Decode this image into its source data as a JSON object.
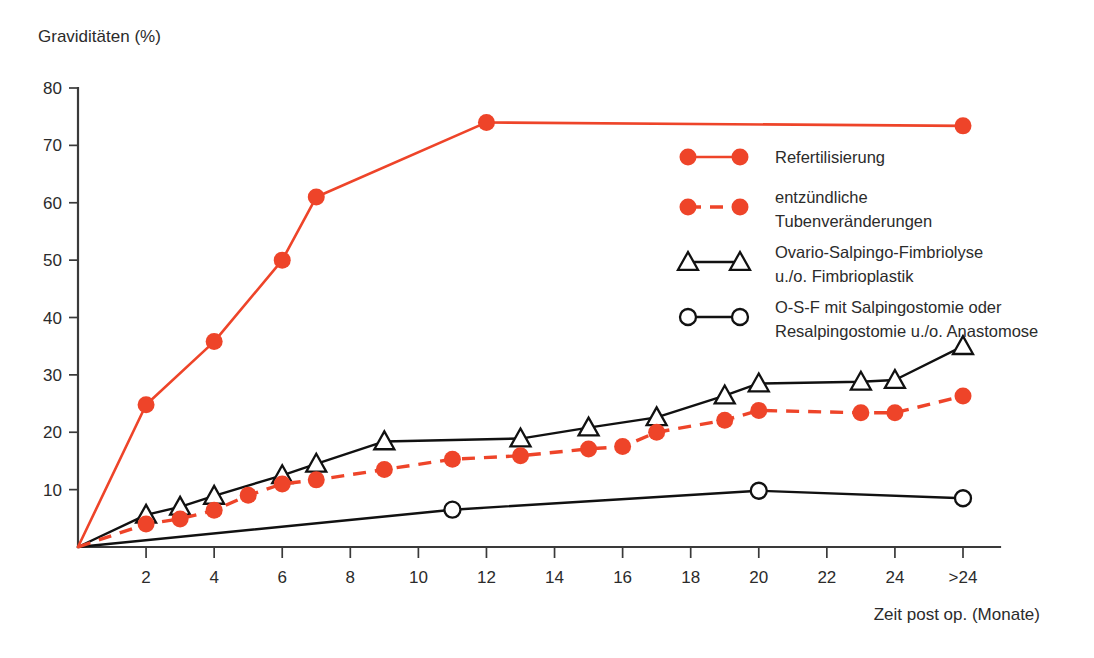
{
  "chart_data": {
    "type": "line",
    "title": "",
    "ylabel": "Graviditäten (%)",
    "xlabel": "Zeit post op. (Monate)",
    "xlim": [
      0,
      26
    ],
    "ylim": [
      0,
      80
    ],
    "grid": false,
    "legend_position": "upper-right",
    "y_ticks": [
      10,
      20,
      30,
      40,
      50,
      60,
      70,
      80
    ],
    "x_ticks": [
      2,
      4,
      6,
      8,
      10,
      12,
      14,
      16,
      18,
      20,
      22,
      24,
      26
    ],
    "x_tick_labels": [
      "2",
      "4",
      "6",
      "8",
      "10",
      "12",
      "14",
      "16",
      "18",
      "20",
      "22",
      "24",
      ">24"
    ],
    "series": [
      {
        "name": "Refertilisierung",
        "color": "#EE4429",
        "style": "solid",
        "marker": "filled-circle",
        "x": [
          0,
          2,
          4,
          6,
          7,
          12,
          26
        ],
        "values": [
          0,
          24.8,
          35.8,
          50.0,
          61.0,
          74.0,
          73.4
        ]
      },
      {
        "name": "entzündliche Tubenveränderungen",
        "color": "#EE4429",
        "style": "dashed",
        "marker": "filled-circle",
        "x": [
          0,
          2,
          3,
          4,
          5,
          6,
          7,
          9,
          11,
          13,
          15,
          16,
          17,
          19,
          20,
          23,
          24,
          26
        ],
        "values": [
          0,
          4.0,
          4.9,
          6.4,
          9.0,
          11.0,
          11.7,
          13.5,
          15.3,
          15.9,
          17.1,
          17.5,
          20.0,
          22.1,
          23.8,
          23.4,
          23.4,
          26.3
        ]
      },
      {
        "name": "Ovario-Salpingo-Fimbriolyse u./o. Fimbrioplastik",
        "color": "#111111",
        "style": "solid",
        "marker": "open-triangle",
        "x": [
          0,
          2,
          3,
          4,
          6,
          7,
          9,
          13,
          15,
          17,
          19,
          20,
          23,
          24,
          26
        ],
        "values": [
          0,
          5.6,
          7.0,
          8.9,
          12.5,
          14.5,
          18.4,
          18.9,
          20.8,
          22.6,
          26.4,
          28.5,
          28.8,
          29.1,
          35.0
        ]
      },
      {
        "name": "O-S-F mit Salpingostomie oder Resalpingostomie u./o. Anastomose",
        "color": "#111111",
        "style": "solid",
        "marker": "open-circle",
        "x": [
          0,
          11,
          20,
          26
        ],
        "values": [
          0,
          6.5,
          9.8,
          8.5
        ]
      }
    ]
  },
  "legend": {
    "items": [
      {
        "label_line1": "Refertilisierung",
        "label_line2": ""
      },
      {
        "label_line1": "entzündliche",
        "label_line2": "Tubenveränderungen"
      },
      {
        "label_line1": "Ovario-Salpingo-Fimbriolyse",
        "label_line2": "u./o. Fimbrioplastik"
      },
      {
        "label_line1": "O-S-F mit Salpingostomie oder",
        "label_line2": "Resalpingostomie u./o. Anastomose"
      }
    ]
  },
  "colors": {
    "red": "#EE4429",
    "black": "#111111",
    "axis": "#3a3a3a",
    "background": "#ffffff"
  }
}
